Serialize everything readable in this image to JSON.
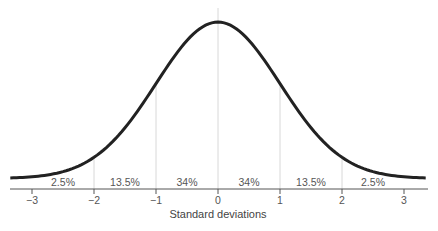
{
  "chart_data": {
    "type": "line",
    "title": "",
    "xlabel": "Standard deviations",
    "ylabel": "",
    "xlim": [
      -3.35,
      3.35
    ],
    "grid": false,
    "legend": null,
    "x_ticks": [
      -3,
      -2,
      -1,
      0,
      1,
      2,
      3
    ],
    "x_tick_labels": [
      "−3",
      "−2",
      "−1",
      "0",
      "1",
      "2",
      "3"
    ],
    "series": [
      {
        "name": "Normal distribution curve",
        "function": "standard normal pdf",
        "mean": 0,
        "sd": 1
      }
    ],
    "reference_lines_x": [
      -2,
      -1,
      0,
      1,
      2
    ],
    "region_labels": [
      {
        "from": -3,
        "to": -2,
        "label": "2.5%"
      },
      {
        "from": -2,
        "to": -1,
        "label": "13.5%"
      },
      {
        "from": -1,
        "to": 0,
        "label": "34%"
      },
      {
        "from": 0,
        "to": 1,
        "label": "34%"
      },
      {
        "from": 1,
        "to": 2,
        "label": "13.5%"
      },
      {
        "from": 2,
        "to": 3,
        "label": "2.5%"
      }
    ]
  },
  "colors": {
    "curve": "#222222",
    "axis": "#555555",
    "reference_line": "#d8d8d8",
    "text": "#555555"
  }
}
